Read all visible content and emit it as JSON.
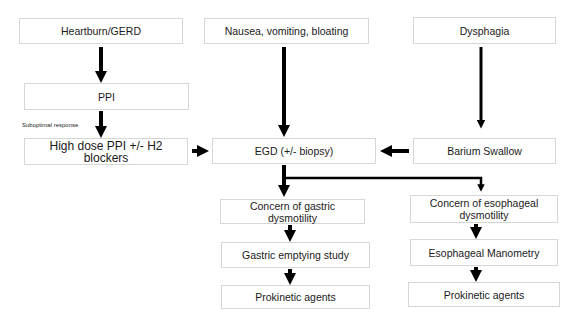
{
  "diagram": {
    "type": "flowchart",
    "nodes": {
      "heartburn": "Heartburn/GERD",
      "nausea": "Nausea, vomiting, bloating",
      "dysphagia": "Dysphagia",
      "ppi": "PPI",
      "high_dose": "High dose PPI +/- H2 blockers",
      "egd": "EGD (+/- biopsy)",
      "barium": "Barium Swallow",
      "gastric_concern": "Concern of gastric dysmotility",
      "gastric_emptying": "Gastric emptying study",
      "gastric_prokinetic": "Prokinetic agents",
      "esoph_concern": "Concern of esophageal dysmotility",
      "esoph_manometry": "Esophageal Manometry",
      "esoph_prokinetic": "Prokinetic agents"
    },
    "edge_labels": {
      "ppi_to_high_dose": "Suboptimal response"
    },
    "edges": [
      [
        "heartburn",
        "ppi"
      ],
      [
        "ppi",
        "high_dose"
      ],
      [
        "high_dose",
        "egd"
      ],
      [
        "nausea",
        "egd"
      ],
      [
        "dysphagia",
        "barium"
      ],
      [
        "barium",
        "egd"
      ],
      [
        "egd",
        "gastric_concern"
      ],
      [
        "egd",
        "esoph_concern"
      ],
      [
        "gastric_concern",
        "gastric_emptying"
      ],
      [
        "gastric_emptying",
        "gastric_prokinetic"
      ],
      [
        "esoph_concern",
        "esoph_manometry"
      ],
      [
        "esoph_manometry",
        "esoph_prokinetic"
      ]
    ],
    "colors": {
      "arrow": "#000000",
      "box_border": "#d6d6d6",
      "background": "#ffffff"
    }
  }
}
